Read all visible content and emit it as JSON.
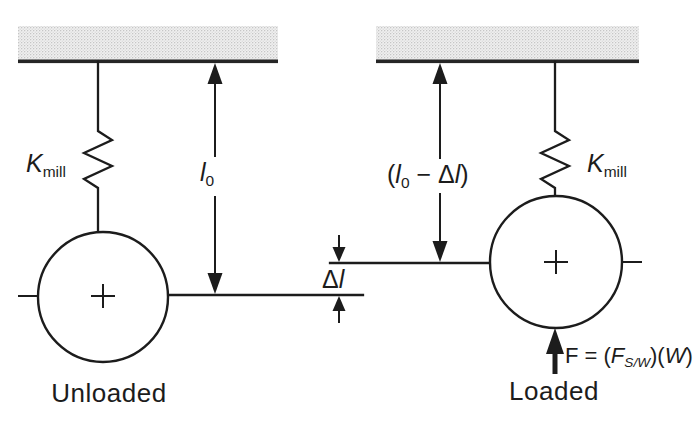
{
  "labels": {
    "left_spring": {
      "symbol": "K",
      "subscript": "mill"
    },
    "right_spring": {
      "symbol": "K",
      "subscript": "mill"
    },
    "unloaded_length": {
      "symbol": "l",
      "subscript": "0"
    },
    "loaded_length": {
      "open_paren": "(",
      "symbol": "l",
      "subscript": "0",
      "minus": " − ",
      "delta": "Δ",
      "symbol2": "l",
      "close_paren": ")"
    },
    "deflection": {
      "delta": "Δ",
      "symbol": "l"
    },
    "force": {
      "lhs": "F",
      "equals": " = ",
      "open_paren": "(",
      "symbol": "F",
      "subscript": "S/W",
      "mid_parens": ")(",
      "weight": "W",
      "close_paren": ")"
    },
    "left_caption": "Unloaded",
    "right_caption": "Loaded"
  },
  "colors": {
    "background": "#ffffff",
    "line": "#1c1c1c",
    "ceiling_fill": "#f0f0f0",
    "ceiling_dots": "#c6c6c6",
    "ceiling_bar": "#262626"
  }
}
